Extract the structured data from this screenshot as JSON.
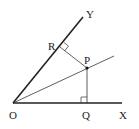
{
  "diagram": {
    "type": "geometry",
    "points": {
      "O": {
        "label": "O",
        "x": 13,
        "y": 103
      },
      "X": {
        "label": "X",
        "x": 122,
        "y": 103
      },
      "Y": {
        "label": "Y",
        "x": 83,
        "y": 17
      },
      "R": {
        "label": "R",
        "x": 60,
        "y": 47
      },
      "P": {
        "label": "P",
        "x": 87,
        "y": 68
      },
      "Q": {
        "label": "Q",
        "x": 87,
        "y": 103
      }
    },
    "segments": [
      {
        "name": "ray-OX",
        "from": "O",
        "to": "X",
        "weight": "thick"
      },
      {
        "name": "ray-OY",
        "from": "O",
        "to": "Y",
        "weight": "thick"
      },
      {
        "name": "bisector-OP",
        "from": "O",
        "to": "P",
        "weight": "thin",
        "extends": true
      },
      {
        "name": "perpendicular-PR",
        "from": "P",
        "to": "R",
        "weight": "thin"
      },
      {
        "name": "perpendicular-PQ",
        "from": "P",
        "to": "Q",
        "weight": "thin"
      }
    ],
    "right_angle_marks": [
      "R",
      "Q"
    ],
    "colors": {
      "line": "#222222",
      "background": "#ffffff"
    }
  }
}
